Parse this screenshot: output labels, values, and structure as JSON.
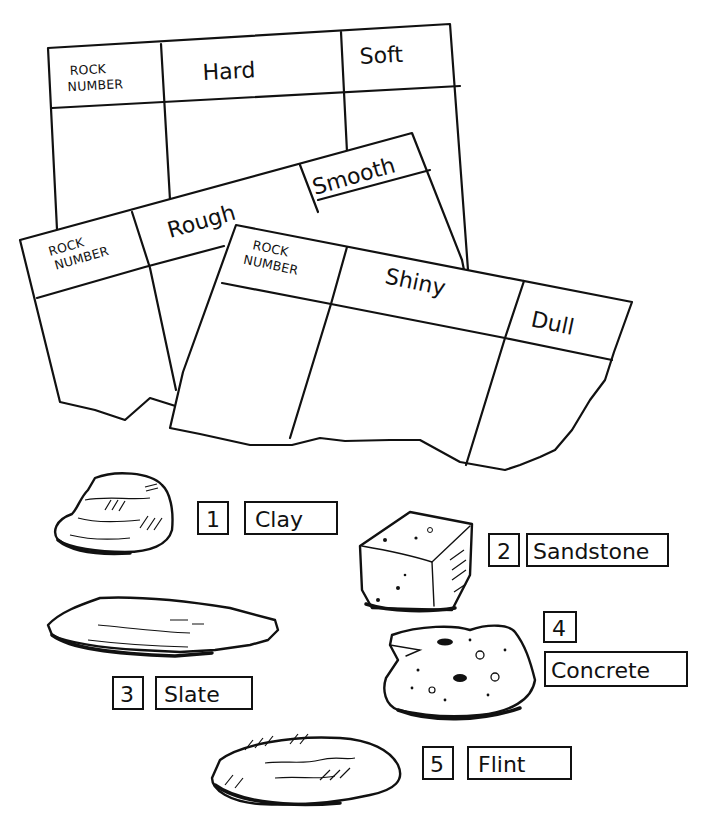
{
  "tables": [
    {
      "id": "hardness",
      "headers": [
        "ROCK NUMBER",
        "Hard",
        "Soft"
      ],
      "header_lines": {
        "rock_number": [
          "ROCK",
          "NUMBER"
        ]
      }
    },
    {
      "id": "texture",
      "headers": [
        "ROCK NUMBER",
        "Rough",
        "Smooth"
      ],
      "header_lines": {
        "rock_number": [
          "ROCK",
          "NUMBER"
        ]
      }
    },
    {
      "id": "lustre",
      "headers": [
        "ROCK NUMBER",
        "Shiny",
        "Dull"
      ],
      "header_lines": {
        "rock_number": [
          "ROCK",
          "NUMBER"
        ]
      }
    }
  ],
  "rocks": [
    {
      "number": "1",
      "name": "Clay",
      "icon": "clay-rock-icon"
    },
    {
      "number": "2",
      "name": "Sandstone",
      "icon": "sandstone-rock-icon"
    },
    {
      "number": "3",
      "name": "Slate",
      "icon": "slate-rock-icon"
    },
    {
      "number": "4",
      "name": "Concrete",
      "icon": "concrete-rock-icon"
    },
    {
      "number": "5",
      "name": "Flint",
      "icon": "flint-rock-icon"
    }
  ],
  "colors": {
    "ink": "#111111",
    "paper": "#ffffff"
  }
}
